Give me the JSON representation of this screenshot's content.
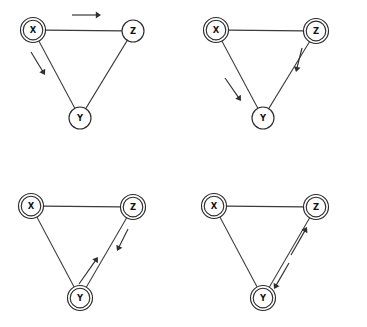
{
  "figure": {
    "width": 367,
    "height": 327,
    "background": "#ffffff",
    "line_color": "#3a3a3a",
    "node_stroke": "#2b2b2b",
    "node_fill": "#ffffff",
    "arrow_color": "#2f2f2f"
  },
  "panels": [
    {
      "id": "panel-top-left",
      "position": "top-left",
      "origin": {
        "x": 0,
        "y": 0
      },
      "nodes": [
        {
          "id": "X",
          "label": "X",
          "cx": 33,
          "cy": 30,
          "double": true
        },
        {
          "id": "Z",
          "label": "Z",
          "cx": 133,
          "cy": 31,
          "double": false
        },
        {
          "id": "Y",
          "label": "Y",
          "cx": 80,
          "cy": 118,
          "double": false
        }
      ],
      "edges": [
        {
          "from": "X",
          "to": "Z"
        },
        {
          "from": "X",
          "to": "Y"
        },
        {
          "from": "Z",
          "to": "Y"
        }
      ],
      "arrows": [
        {
          "from": "X",
          "to": "Z",
          "direction": "right",
          "x1": 72,
          "y1": 15,
          "x2": 101,
          "y2": 15
        },
        {
          "from": "X",
          "to": "Y",
          "direction": "down-right",
          "x1": 31,
          "y1": 52,
          "x2": 45,
          "y2": 75
        }
      ]
    },
    {
      "id": "panel-top-right",
      "position": "top-right",
      "origin": {
        "x": 183,
        "y": 0
      },
      "nodes": [
        {
          "id": "X",
          "label": "X",
          "cx": 33,
          "cy": 30,
          "double": true
        },
        {
          "id": "Z",
          "label": "Z",
          "cx": 133,
          "cy": 31,
          "double": true
        },
        {
          "id": "Y",
          "label": "Y",
          "cx": 80,
          "cy": 118,
          "double": false
        }
      ],
      "edges": [
        {
          "from": "X",
          "to": "Z"
        },
        {
          "from": "X",
          "to": "Y"
        },
        {
          "from": "Z",
          "to": "Y"
        }
      ],
      "arrows": [
        {
          "from": "X",
          "to": "Y",
          "direction": "down-right",
          "x1": 42,
          "y1": 78,
          "x2": 58,
          "y2": 101
        },
        {
          "from": "Z",
          "to": "Y",
          "direction": "down",
          "x1": 119,
          "y1": 48,
          "x2": 113,
          "y2": 72
        }
      ]
    },
    {
      "id": "panel-bottom-left",
      "position": "bottom-left",
      "origin": {
        "x": 0,
        "y": 163
      },
      "nodes": [
        {
          "id": "X",
          "label": "X",
          "cx": 31,
          "cy": 43,
          "double": true
        },
        {
          "id": "Z",
          "label": "Z",
          "cx": 133,
          "cy": 44,
          "double": true
        },
        {
          "id": "Y",
          "label": "Y",
          "cx": 80,
          "cy": 135,
          "double": true
        }
      ],
      "edges": [
        {
          "from": "X",
          "to": "Z"
        },
        {
          "from": "X",
          "to": "Y"
        },
        {
          "from": "Z",
          "to": "Y"
        }
      ],
      "arrows": [
        {
          "from": "Y",
          "to": "Z",
          "direction": "up-right",
          "x1": 79,
          "y1": 121,
          "x2": 98,
          "y2": 94
        },
        {
          "from": "Z",
          "to": "Y",
          "direction": "down-left",
          "x1": 128,
          "y1": 66,
          "x2": 117,
          "y2": 88
        }
      ]
    },
    {
      "id": "panel-bottom-right",
      "position": "bottom-right",
      "origin": {
        "x": 183,
        "y": 163
      },
      "nodes": [
        {
          "id": "X",
          "label": "X",
          "cx": 31,
          "cy": 43,
          "double": true
        },
        {
          "id": "Z",
          "label": "Z",
          "cx": 133,
          "cy": 44,
          "double": true
        },
        {
          "id": "Y",
          "label": "Y",
          "cx": 80,
          "cy": 135,
          "double": true
        }
      ],
      "edges": [
        {
          "from": "X",
          "to": "Z"
        },
        {
          "from": "X",
          "to": "Y"
        },
        {
          "from": "Z",
          "to": "Y"
        }
      ],
      "arrows": [
        {
          "from": "Y",
          "to": "Z",
          "direction": "up-right",
          "x1": 108,
          "y1": 92,
          "x2": 124,
          "y2": 64
        },
        {
          "from": "Z",
          "to": "Y",
          "direction": "down-left",
          "x1": 106,
          "y1": 100,
          "x2": 91,
          "y2": 126
        }
      ]
    }
  ],
  "geometry": {
    "node_radius_outer": 12.5,
    "node_radius_inner": 9.8,
    "node_radius_single": 11.0,
    "arrow_head_length": 5.2,
    "arrow_head_width": 3.4
  }
}
